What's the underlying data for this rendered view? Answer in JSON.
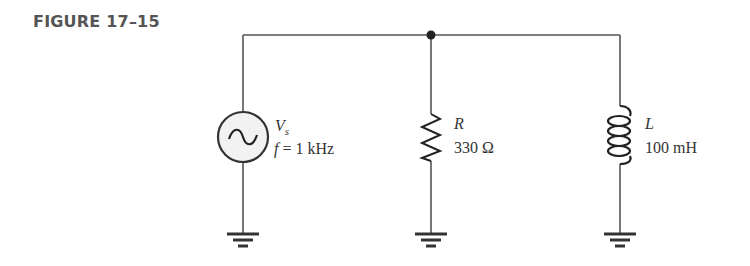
{
  "figure": {
    "label": "FIGURE 17–15"
  },
  "circuit": {
    "type": "parallel RL circuit",
    "source": {
      "symbol_main": "V",
      "symbol_sub": "s",
      "frequency_var": "f",
      "frequency_value": " = 1 kHz",
      "icon": "ac-sine-source"
    },
    "resistor": {
      "symbol": "R",
      "value": "330 Ω",
      "icon": "zigzag-resistor"
    },
    "inductor": {
      "symbol": "L",
      "value": "100 mH",
      "icon": "coil-inductor"
    },
    "grounds": [
      "source-ground",
      "resistor-ground",
      "inductor-ground"
    ],
    "colors": {
      "wire": "#555555",
      "text": "#333333",
      "source_fill": "#f2f2f2"
    }
  }
}
